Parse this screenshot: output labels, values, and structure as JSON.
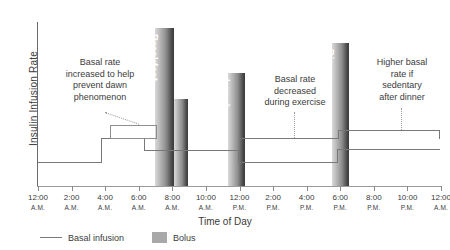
{
  "chart_data": {
    "type": "line",
    "title": "",
    "xlabel": "Time of Day",
    "ylabel": "Insulin Infusion Rate",
    "grid": false,
    "legend_position": "bottom-left",
    "x_tick_labels": [
      {
        "time": "12:00",
        "meridiem": "A.M."
      },
      {
        "time": "2:00",
        "meridiem": "A.M."
      },
      {
        "time": "4:00",
        "meridiem": "A.M."
      },
      {
        "time": "6:00",
        "meridiem": "A.M."
      },
      {
        "time": "8:00",
        "meridiem": "A.M."
      },
      {
        "time": "10:00",
        "meridiem": "A.M."
      },
      {
        "time": "12:00",
        "meridiem": "P.M."
      },
      {
        "time": "2:00",
        "meridiem": "P.M."
      },
      {
        "time": "4:00",
        "meridiem": "P.M."
      },
      {
        "time": "6:00",
        "meridiem": "P.M."
      },
      {
        "time": "8:00",
        "meridiem": "P.M."
      },
      {
        "time": "10:00",
        "meridiem": "P.M."
      },
      {
        "time": "12:00",
        "meridiem": "A.M."
      }
    ],
    "series": [
      {
        "name": "Basal infusion",
        "type": "step",
        "color": "#77787b",
        "points": [
          {
            "x": "12:00 A.M.",
            "level": "baseline"
          },
          {
            "x": "4:40 A.M.",
            "level": "raised-dawn"
          },
          {
            "x": "7:00 A.M.",
            "level": "post-dawn"
          },
          {
            "x": "1:00 P.M.",
            "level": "reduced-exercise"
          },
          {
            "x": "7:30 P.M.",
            "level": "post-dinner"
          },
          {
            "x": "12:40 A.M.",
            "level": "end"
          }
        ]
      },
      {
        "name": "Exercise basal segment",
        "type": "step",
        "color": "#77787b",
        "points": [
          {
            "x": "1:00 P.M.",
            "level": "raised-exercise-upper"
          },
          {
            "x": "7:30 P.M.",
            "level": "post-dinner-upper"
          },
          {
            "x": "12:40 A.M.",
            "level": "end-upper"
          }
        ]
      }
    ],
    "bolus_bars": [
      {
        "label": "Breakfast",
        "x": "7:20 A.M.",
        "height_rank": 1
      },
      {
        "label": "Breakfast tail",
        "x": "8:40 A.M.",
        "height_rank": 3
      },
      {
        "label": "Lunch",
        "x": "12:20 P.M.",
        "height_rank": 2
      },
      {
        "label": "Dinner",
        "x": "7:40 P.M.",
        "height_rank": 1
      }
    ],
    "annotations": [
      {
        "id": "dawn",
        "text": "Basal rate increased to help prevent dawn phenomenon"
      },
      {
        "id": "exercise",
        "text": "Basal rate decreased during exercise"
      },
      {
        "id": "sedentary",
        "text": "Higher basal rate if sedentary after dinner"
      }
    ]
  },
  "axes": {
    "y_title": "Insulin Infusion Rate",
    "x_title": "Time of Day"
  },
  "bolus": {
    "breakfast": "Breakfast",
    "lunch": "Lunch",
    "dinner": "Dinner"
  },
  "annotations": {
    "dawn": {
      "line1": "Basal rate",
      "line2": "increased to help",
      "line3": "prevent dawn",
      "line4": "phenomenon"
    },
    "exercise": {
      "line1": "Basal rate",
      "line2": "decreased",
      "line3": "during exercise"
    },
    "sedentary": {
      "line1": "Higher basal",
      "line2": "rate if",
      "line3": "sedentary",
      "line4": "after dinner"
    }
  },
  "legend": {
    "basal_label": "Basal infusion",
    "bolus_label": "Bolus"
  },
  "colors": {
    "line": "#77787b",
    "bolus_light": "#d9d9d9",
    "bolus_dark": "#3a3a3a",
    "text": "#3b3b3b",
    "axis": "#8a8a8a"
  }
}
